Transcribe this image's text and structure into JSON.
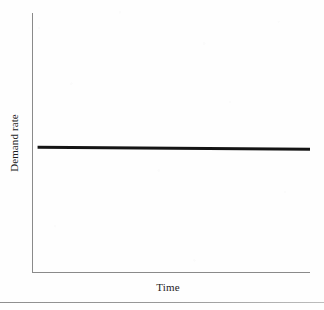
{
  "figure": {
    "background_color": "#fefefe",
    "axis_color": "#8a8a8a",
    "series_color": "#141414"
  },
  "chart_data": {
    "type": "line",
    "title": "",
    "subtitle": "",
    "xlabel": "Time",
    "ylabel": "Demand rate",
    "grid": false,
    "legend": null,
    "legend_position": "none",
    "xticks": [],
    "yticks": [],
    "xticklabels": [],
    "yticklabels": [],
    "xlim": [
      0,
      1
    ],
    "ylim": [
      0,
      1
    ],
    "annotations": [],
    "series": [
      {
        "name": "Demand rate",
        "color": "#141414",
        "linewidth": 3,
        "x": [
          0.02,
          1.0
        ],
        "y": [
          0.482,
          0.474
        ],
        "description": "Constant demand rate over time"
      }
    ]
  },
  "axes": {
    "y_axis_label": "Demand rate",
    "x_axis_label": "Time"
  },
  "footer": {
    "rule_color": "#8f8f8f"
  }
}
